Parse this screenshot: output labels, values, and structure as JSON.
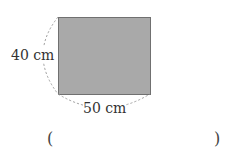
{
  "figure": {
    "shape": "rectangle",
    "fill_color": "#a9a9a9",
    "border_color": "#707070",
    "height_label": "40 cm",
    "width_label": "50 cm"
  },
  "answer": {
    "open_paren": "(",
    "close_paren": ")",
    "value": ""
  }
}
